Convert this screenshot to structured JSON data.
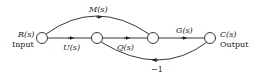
{
  "diagram": {
    "type": "signal-flow-graph",
    "nodes": [
      {
        "id": "R",
        "label": "R(s)",
        "sublabel": "Input"
      },
      {
        "id": "n2",
        "label": ""
      },
      {
        "id": "n3",
        "label": ""
      },
      {
        "id": "C",
        "label": "C(s)",
        "sublabel": "Output"
      }
    ],
    "branches": [
      {
        "from": "R",
        "to": "n2",
        "gain": "U(s)"
      },
      {
        "from": "n2",
        "to": "n3",
        "gain": "Q(s)"
      },
      {
        "from": "n3",
        "to": "C",
        "gain": "G(s)"
      },
      {
        "from": "R",
        "to": "n3",
        "gain": "M(s)"
      },
      {
        "from": "C",
        "to": "n2",
        "gain": "−1"
      }
    ]
  },
  "labels": {
    "input_var": "R(s)",
    "input_text": "Input",
    "output_var": "C(s)",
    "output_text": "Output",
    "u": "U(s)",
    "q": "Q(s)",
    "g": "G(s)",
    "m": "M(s)",
    "fb": "−1"
  }
}
